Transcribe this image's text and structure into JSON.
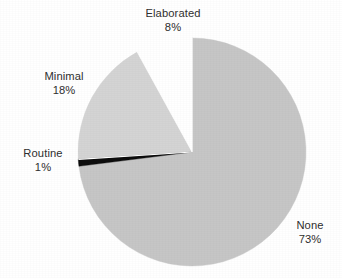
{
  "chart_data": {
    "type": "pie",
    "title": "",
    "labels": [
      "None",
      "Elaborated",
      "Minimal",
      "Routine"
    ],
    "values": [
      73,
      18,
      8,
      1
    ],
    "unit": "%",
    "slices": [
      {
        "name": "None",
        "value": 73,
        "label_name": "None",
        "label_value": "73%",
        "color": "#c6c6c6",
        "start_angle_deg": 0,
        "end_angle_deg": 262.8,
        "exploded": false
      },
      {
        "name": "Routine",
        "value": 1,
        "label_name": "Routine",
        "label_value": "1%",
        "color": "#0d0d0d",
        "start_angle_deg": 262.8,
        "end_angle_deg": 266.4,
        "exploded": false
      },
      {
        "name": "Minimal",
        "value": 18,
        "label_name": "Minimal",
        "label_value": "18%",
        "color": "#d4d4d4",
        "start_angle_deg": 266.4,
        "end_angle_deg": 331.2,
        "exploded": false
      },
      {
        "name": "Elaborated",
        "value": 8,
        "label_name": "Elaborated",
        "label_value": "8%",
        "color": "#ffffff",
        "start_angle_deg": 331.2,
        "end_angle_deg": 360,
        "exploded": true
      }
    ],
    "legend": "none",
    "grid": false,
    "xlabel": "",
    "ylabel": "",
    "background_color": "#ffffff",
    "text_color": "#2f2f2f",
    "geometry": {
      "center_x": 192,
      "center_y": 152,
      "radius": 114
    }
  },
  "labels": {
    "elaborated": {
      "name": "Elaborated",
      "value": "8%"
    },
    "minimal": {
      "name": "Minimal",
      "value": "18%"
    },
    "routine": {
      "name": "Routine",
      "value": "1%"
    },
    "none": {
      "name": "None",
      "value": "73%"
    }
  }
}
